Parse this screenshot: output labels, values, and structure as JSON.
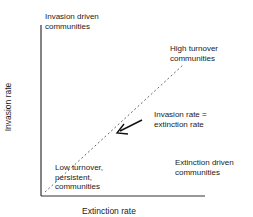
{
  "diagram": {
    "axes": {
      "x_label": "Extinction rate",
      "y_label": "Invasion rate"
    },
    "regions": {
      "top_left": [
        "Invasion driven",
        "communities"
      ],
      "top_right": [
        "High turnover",
        "communities"
      ],
      "bottom_left": [
        "Low turnover,",
        "persistent,",
        "communities"
      ],
      "bottom_right": [
        "Extinction driven",
        "communities"
      ]
    },
    "diagonal": {
      "label": [
        "Invasion rate =",
        "extinction rate"
      ],
      "style": "dashed"
    },
    "colors": {
      "line": "#333333",
      "text": "#1a1a1a"
    }
  }
}
